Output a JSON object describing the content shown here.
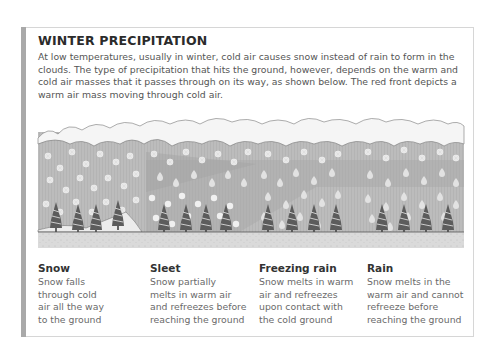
{
  "title": "WINTER PRECIPITATION",
  "intro": "At low temperatures, usually in winter, cold air causes snow instead of rain to form in the clouds. The type of precipitation that hits the ground, however, depends on the warm and cold air masses that it passes through on its way, as shown below. The red front depicts a warm air mass moving through cold air.",
  "illustration": {
    "description": "Cross-section: clouds at top, falling snowflakes/ice pellets/raindrops, a warm-air wedge (darker band), trees on the ground",
    "zones": [
      "snow",
      "sleet",
      "freezing-rain",
      "rain"
    ],
    "colors": {
      "sky": "#bdbdbd",
      "warm_air": "#a8a8a8",
      "cloud": "#f4f4f4",
      "ground": "#d9d9d9",
      "tree": "#5a5a5a",
      "flake": "#ececec"
    }
  },
  "captions": [
    {
      "heading": "Snow",
      "lines": [
        "Snow falls",
        "through cold",
        "air all the way",
        "to the ground"
      ]
    },
    {
      "heading": "Sleet",
      "lines": [
        "Snow partially",
        "melts in warm air",
        "and refreezes before",
        "reaching the ground"
      ]
    },
    {
      "heading": "Freezing rain",
      "lines": [
        "Snow melts in warm",
        "air and refreezes",
        "upon contact with",
        "the cold ground"
      ]
    },
    {
      "heading": "Rain",
      "lines": [
        "Snow melts in the",
        "warm air and cannot",
        "refreeze before",
        "reaching the ground"
      ]
    }
  ]
}
